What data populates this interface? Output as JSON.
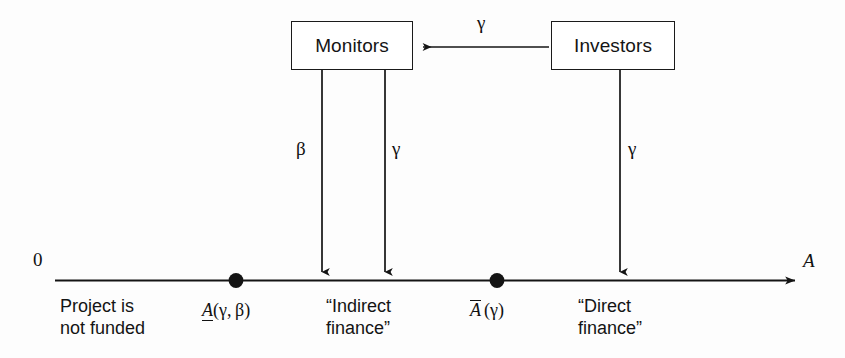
{
  "figure": {
    "axis": {
      "origin_label": "0",
      "variable_label": "A"
    },
    "nodes": [
      {
        "id": "monitors",
        "label": "Monitors"
      },
      {
        "id": "investors",
        "label": "Investors"
      }
    ],
    "edges": [
      {
        "id": "investors-to-monitors",
        "label": "γ",
        "from": "investors",
        "to": "monitors",
        "direction": "horizontal-left"
      },
      {
        "id": "monitors-beta-to-axis",
        "label": "β",
        "from": "monitors",
        "to": "axis",
        "direction": "vertical-down"
      },
      {
        "id": "monitors-gamma-to-axis",
        "label": "γ",
        "from": "monitors",
        "to": "axis",
        "direction": "vertical-down"
      },
      {
        "id": "investors-gamma-to-axis",
        "label": "γ",
        "from": "investors",
        "to": "axis",
        "direction": "vertical-down"
      }
    ],
    "thresholds": [
      {
        "id": "lower-threshold",
        "symbol": "A",
        "decoration": "underline",
        "args": "(γ, β)"
      },
      {
        "id": "upper-threshold",
        "symbol": "A",
        "decoration": "overline",
        "args": "(γ)"
      }
    ],
    "regions": [
      {
        "id": "not-funded",
        "line1": "Project is",
        "line2": "not funded"
      },
      {
        "id": "indirect-finance",
        "line1": "“Indirect",
        "line2": "finance”"
      },
      {
        "id": "direct-finance",
        "line1": "“Direct",
        "line2": "finance”"
      }
    ]
  }
}
